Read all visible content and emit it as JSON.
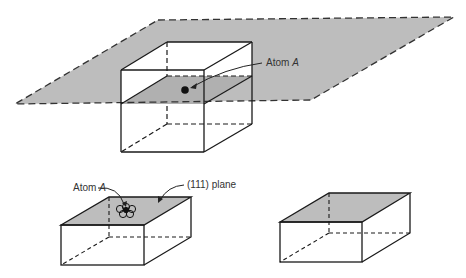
{
  "figure": {
    "top": {
      "label_atom": "Atom A",
      "atom_name": "Atom",
      "atom_letter": "A"
    },
    "bottom_left": {
      "label_atom": "Atom A",
      "atom_name": "Atom",
      "atom_letter": "A",
      "label_plane": "(111) plane"
    },
    "colors": {
      "plane_fill": "#bdbdbd",
      "line": "#1a1a1a",
      "background": "#ffffff"
    }
  }
}
